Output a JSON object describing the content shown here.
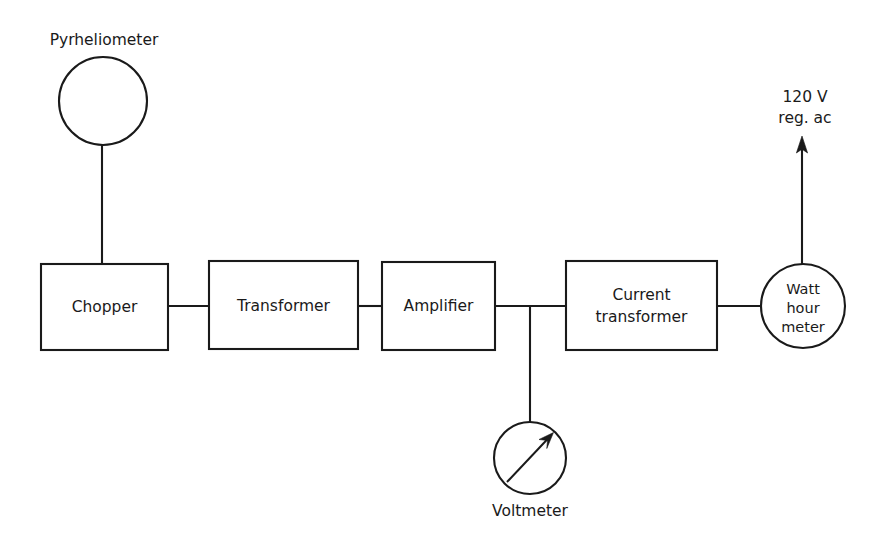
{
  "diagram": {
    "stroke_color": "#1a1a1a",
    "background_color": "#ffffff",
    "blocks": [
      {
        "id": "chopper",
        "label": "Chopper",
        "shape": "rect",
        "x": 41,
        "y": 264,
        "w": 127,
        "h": 86
      },
      {
        "id": "transformer",
        "label": "Transformer",
        "shape": "rect",
        "x": 209,
        "y": 261,
        "w": 149,
        "h": 88
      },
      {
        "id": "amplifier",
        "label": "Amplifier",
        "shape": "rect",
        "x": 382,
        "y": 262,
        "w": 113,
        "h": 88
      },
      {
        "id": "current-transformer",
        "label_line1": "Current",
        "label_line2": "transformer",
        "shape": "rect",
        "x": 566,
        "y": 261,
        "w": 151,
        "h": 89
      }
    ],
    "instruments": [
      {
        "id": "pyrheliometer",
        "label": "Pyrheliometer",
        "shape": "circle",
        "cx": 103,
        "cy": 101,
        "r": 44,
        "label_x": 104,
        "label_y": 45
      },
      {
        "id": "watt-hour-meter",
        "label_line1": "Watt",
        "label_line2": "hour",
        "label_line3": "meter",
        "shape": "circle",
        "cx": 803,
        "cy": 306,
        "r": 42
      },
      {
        "id": "voltmeter",
        "label": "Voltmeter",
        "shape": "circle",
        "cx": 530,
        "cy": 458,
        "r": 36,
        "label_x": 530,
        "label_y": 516
      }
    ],
    "annotations": [
      {
        "id": "supply",
        "line1": "120 V",
        "line2": "reg. ac",
        "x": 805,
        "y1": 102,
        "y2": 123
      }
    ]
  }
}
